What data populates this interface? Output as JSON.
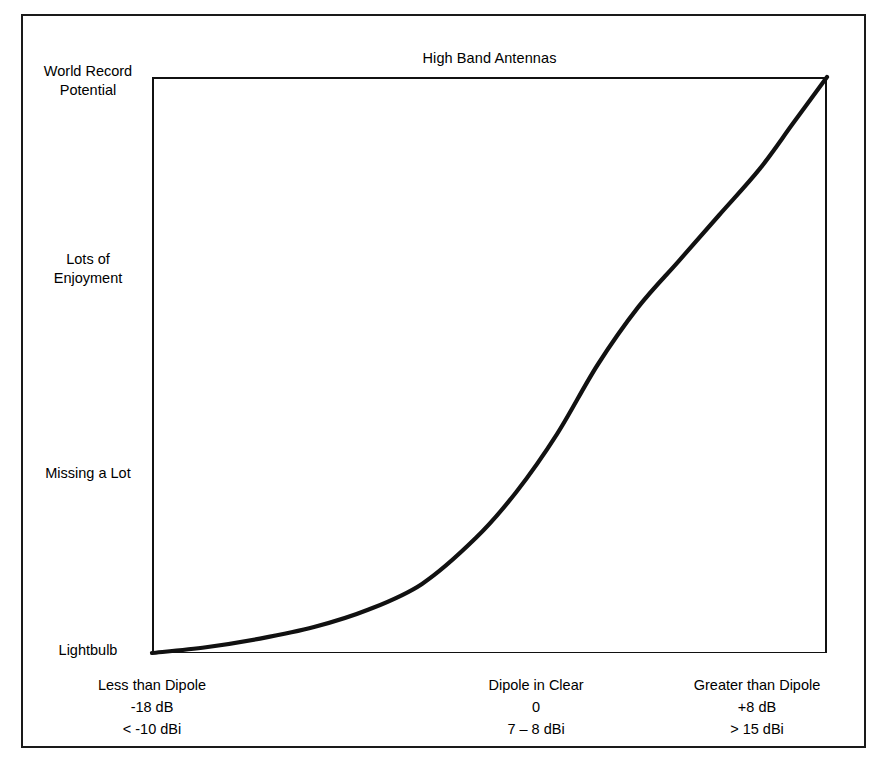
{
  "chart_data": {
    "type": "line",
    "title": "High Band Antennas",
    "xlabel": "",
    "ylabel": "",
    "grid": false,
    "legend": null,
    "ytick_labels": [
      "Lightbulb",
      "Missing a Lot",
      "Lots of Enjoyment",
      "World Record Potential"
    ],
    "ytick_values": [
      0,
      33,
      70,
      100
    ],
    "ylim": [
      0,
      100
    ],
    "xtick_labels": [
      "Less than Dipole",
      "Dipole in Clear",
      "Greater than Dipole"
    ],
    "xtick_sublabels": [
      [
        "-18 dB",
        "< -10 dBi"
      ],
      [
        "0",
        "7 – 8 dBi"
      ],
      [
        "+8 dB",
        "> 15 dBi"
      ]
    ],
    "xtick_values": [
      0,
      57,
      90
    ],
    "xlim": [
      0,
      100
    ],
    "series": [
      {
        "name": "Antenna performance",
        "x": [
          0,
          8,
          16,
          24,
          32,
          40,
          48,
          54,
          60,
          66,
          72,
          78,
          84,
          90,
          95,
          100
        ],
        "y": [
          0,
          1,
          2.5,
          4.5,
          7.5,
          12,
          20,
          28,
          38,
          50,
          60,
          68,
          76,
          84,
          92,
          100
        ]
      }
    ]
  },
  "chart": {
    "title": "High Band Antennas",
    "y_labels": [
      {
        "id": "world-record",
        "text": "World Record\nPotential",
        "line1": "World Record",
        "line2": "Potential"
      },
      {
        "id": "lots-enjoyment",
        "text": "Lots of\nEnjoyment",
        "line1": "Lots of",
        "line2": "Enjoyment"
      },
      {
        "id": "missing-lot",
        "text": "Missing a Lot",
        "line1": "Missing a Lot",
        "line2": ""
      },
      {
        "id": "lightbulb",
        "text": "Lightbulb",
        "line1": "Lightbulb",
        "line2": ""
      }
    ],
    "x_labels": [
      {
        "id": "less-than-dipole",
        "line1": "Less than Dipole",
        "line2": "-18 dB",
        "line3": "< -10 dBi"
      },
      {
        "id": "dipole-in-clear",
        "line1": "Dipole in Clear",
        "line2": "0",
        "line3": "7 – 8 dBi"
      },
      {
        "id": "greater-than-dipole",
        "line1": "Greater than Dipole",
        "line2": "+8 dB",
        "line3": "> 15 dBi"
      }
    ],
    "colors": {
      "curve": "#111111",
      "frame": "#111111",
      "outer_border": "#1a1a1a",
      "background": "#ffffff",
      "text": "#000000"
    }
  }
}
